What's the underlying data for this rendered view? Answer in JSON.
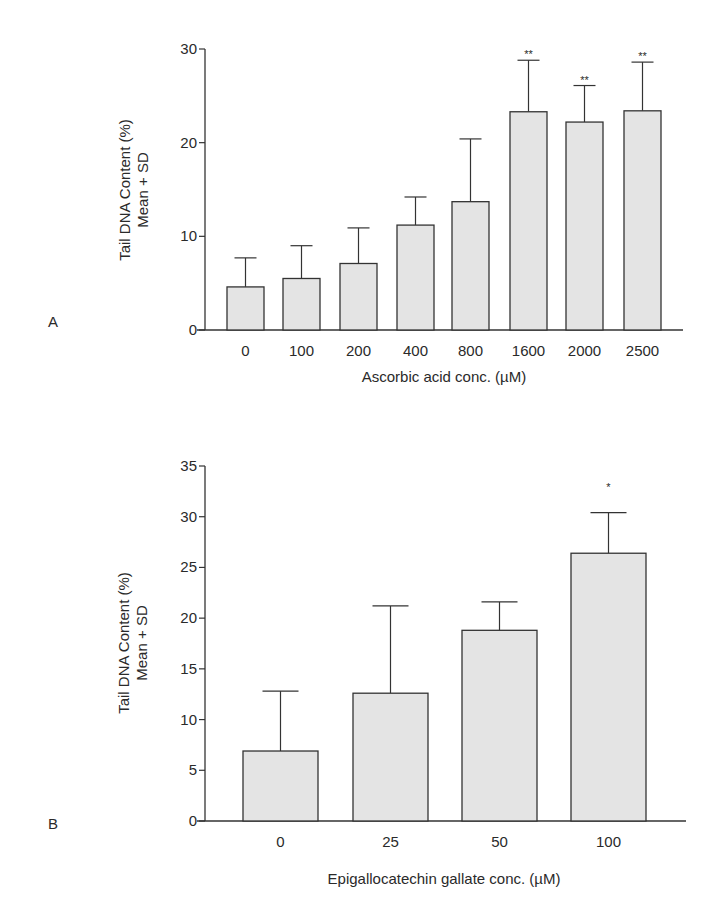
{
  "panels": {
    "a": {
      "label": "A"
    },
    "b": {
      "label": "B"
    }
  },
  "chart_data": [
    {
      "type": "bar",
      "panel": "A",
      "title": "",
      "xlabel": "Ascorbic acid conc. (µM)",
      "ylabel": "Tail DNA Content (%)",
      "ylabel2": "Mean + SD",
      "categories": [
        "0",
        "100",
        "200",
        "400",
        "800",
        "1600",
        "2000",
        "2500"
      ],
      "values": [
        4.6,
        5.5,
        7.1,
        11.2,
        13.7,
        23.3,
        22.2,
        23.4
      ],
      "error_upper": [
        7.7,
        9.0,
        10.9,
        14.2,
        20.4,
        28.8,
        26.1,
        28.6
      ],
      "annotations": [
        "",
        "",
        "",
        "",
        "",
        "**",
        "**",
        "**"
      ],
      "ylim": [
        0,
        30
      ],
      "yticks": [
        "0",
        "10",
        "20",
        "30"
      ],
      "grid": false,
      "bar_color": "#e4e4e4"
    },
    {
      "type": "bar",
      "panel": "B",
      "title": "",
      "xlabel": "Epigallocatechin gallate conc. (µM)",
      "ylabel": "Tail DNA Content (%)",
      "ylabel2": "Mean + SD",
      "categories": [
        "0",
        "25",
        "50",
        "100"
      ],
      "values": [
        6.9,
        12.6,
        18.8,
        26.4
      ],
      "error_upper": [
        12.8,
        21.2,
        21.6,
        30.4
      ],
      "annotations": [
        "",
        "",
        "",
        "*"
      ],
      "ylim": [
        0,
        35
      ],
      "yticks": [
        "0",
        "5",
        "10",
        "15",
        "20",
        "25",
        "30",
        "35"
      ],
      "grid": false,
      "bar_color": "#e4e4e4"
    }
  ]
}
